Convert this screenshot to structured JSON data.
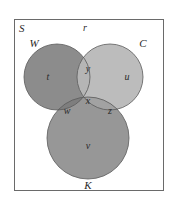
{
  "diagram": {
    "type": "venn",
    "universe": {
      "label": "S",
      "outside_region": "r"
    },
    "sets": [
      {
        "id": "W",
        "label": "W",
        "color": "#8e8e8e"
      },
      {
        "id": "C",
        "label": "C",
        "color": "#bdbdbd"
      },
      {
        "id": "K",
        "label": "K",
        "color": "#9a9a9a"
      }
    ],
    "regions": {
      "W_only": "t",
      "C_only": "u",
      "K_only": "v",
      "W_and_C_only": "y",
      "W_and_K_only": "w",
      "C_and_K_only": "z",
      "W_and_C_and_K": "x",
      "outside": "r"
    }
  },
  "colors": {
    "border": "#6a6a6a",
    "circle_stroke": "#5a5a5a",
    "w_fill": "#8c8c8c",
    "c_fill": "#bcbcbc",
    "k_fill": "#979797",
    "wc_fill": "#b3b3b3",
    "wk_fill": "#7f7f7f",
    "ck_fill": "#a3a3a3",
    "wck_fill": "#a9a9a9"
  }
}
